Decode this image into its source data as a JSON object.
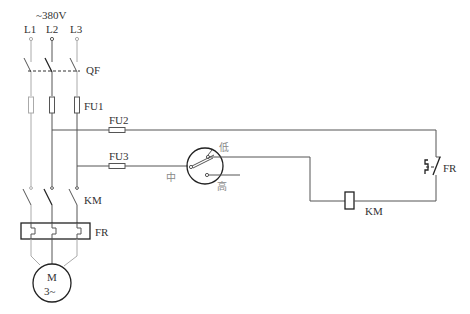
{
  "diagram": {
    "supply": {
      "voltage_label": "~380V",
      "phases": [
        "L1",
        "L2",
        "L3"
      ]
    },
    "components": {
      "breaker": {
        "label": "QF"
      },
      "main_fuses": {
        "label": "FU1"
      },
      "control_fuse_1": {
        "label": "FU2"
      },
      "control_fuse_2": {
        "label": "FU3"
      },
      "contactor_main": {
        "label": "KM"
      },
      "thermal_relay_main": {
        "label": "FR"
      },
      "motor": {
        "label": "M",
        "sublabel": "3~"
      },
      "selector_switch": {
        "positions": {
          "low": "低",
          "middle": "中",
          "high": "高"
        }
      },
      "contactor_coil": {
        "label": "KM"
      },
      "thermal_relay_contact": {
        "label": "FR"
      }
    },
    "colors": {
      "line": "#555555",
      "label": "#333333",
      "chinese_label": "#888888"
    }
  }
}
